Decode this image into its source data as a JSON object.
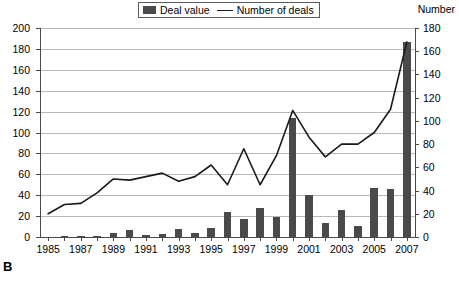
{
  "panel_label": "B",
  "legend": {
    "position": "top-center",
    "items": [
      {
        "label": "Deal value",
        "marker": "bar-swatch-icon",
        "color": "#4a4a4a"
      },
      {
        "label": "Number of deals",
        "marker": "line-swatch-icon",
        "color": "#1a1a1a"
      }
    ]
  },
  "right_axis_caption": "Number",
  "chart_data": {
    "type": "bar",
    "title": "",
    "subtitle": "",
    "xlabel": "",
    "ylabel": "",
    "y2label": "Number",
    "grid": true,
    "legend_position": "top-center",
    "categories": [
      "1985",
      "1986",
      "1987",
      "1988",
      "1989",
      "1990",
      "1991",
      "1992",
      "1993",
      "1994",
      "1995",
      "1996",
      "1997",
      "1998",
      "1999",
      "2000",
      "2001",
      "2002",
      "2003",
      "2004",
      "2005",
      "2006",
      "2007"
    ],
    "xtick_labels": [
      "1985",
      "",
      "1987",
      "",
      "1989",
      "",
      "1991",
      "",
      "1993",
      "",
      "1995",
      "",
      "1997",
      "",
      "1999",
      "",
      "2001",
      "",
      "2003",
      "",
      "2005",
      "",
      "2007"
    ],
    "ylim": [
      0,
      200
    ],
    "yticks": [
      0,
      20,
      40,
      60,
      80,
      100,
      120,
      140,
      160,
      180,
      200
    ],
    "y2lim": [
      0,
      180
    ],
    "y2ticks": [
      0,
      20,
      40,
      60,
      80,
      100,
      120,
      140,
      160,
      180
    ],
    "series": [
      {
        "name": "Deal value",
        "type": "bar",
        "axis": "left",
        "color": "#4a4a4a",
        "values": [
          0,
          1,
          1,
          1,
          4,
          7,
          2,
          3,
          8,
          4,
          9,
          24,
          17,
          28,
          19,
          114,
          40,
          13,
          26,
          11,
          47,
          46,
          187
        ]
      },
      {
        "name": "Number of deals",
        "type": "line",
        "axis": "right",
        "color": "#1a1a1a",
        "values": [
          20,
          28,
          29,
          38,
          50,
          49,
          52,
          55,
          48,
          52,
          62,
          45,
          76,
          45,
          70,
          109,
          86,
          69,
          80,
          80,
          90,
          110,
          168
        ]
      }
    ]
  }
}
